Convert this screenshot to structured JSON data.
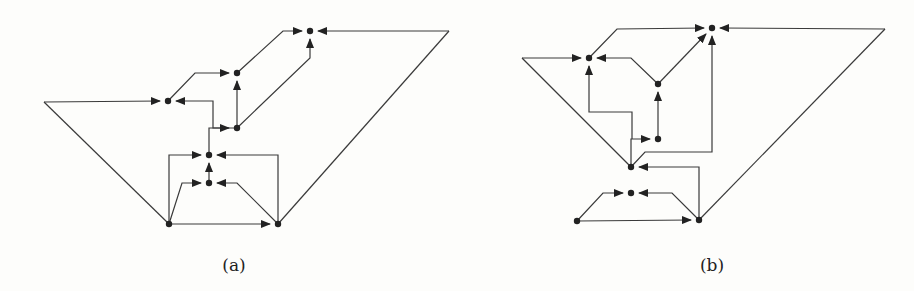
{
  "figures": [
    {
      "id": "a",
      "caption": "(a)",
      "caption_x": 234,
      "nodes": [
        {
          "id": "top",
          "x": 310,
          "y": 31
        },
        {
          "id": "upper",
          "x": 237,
          "y": 73
        },
        {
          "id": "left",
          "x": 168,
          "y": 101
        },
        {
          "id": "hub",
          "x": 237,
          "y": 128
        },
        {
          "id": "mid",
          "x": 209,
          "y": 155
        },
        {
          "id": "lowmid",
          "x": 209,
          "y": 183
        },
        {
          "id": "bl",
          "x": 169,
          "y": 224
        },
        {
          "id": "br",
          "x": 278,
          "y": 224
        }
      ],
      "edges": [
        {
          "points": [
            [
              44,
              102
            ],
            [
              160,
              101
            ]
          ],
          "arrow": true
        },
        {
          "points": [
            [
              44,
              102
            ],
            [
              169,
              224
            ]
          ],
          "arrow": false
        },
        {
          "points": [
            [
              237,
              128
            ],
            [
              213,
              128
            ],
            [
              213,
              101
            ],
            [
              176,
              101
            ]
          ],
          "arrow": true
        },
        {
          "points": [
            [
              168,
              101
            ],
            [
              195,
              73
            ],
            [
              229,
              73
            ]
          ],
          "arrow": true
        },
        {
          "points": [
            [
              237,
              128
            ],
            [
              237,
              81
            ]
          ],
          "arrow": true
        },
        {
          "points": [
            [
              237,
              73
            ],
            [
              283,
              31
            ],
            [
              302,
              31
            ]
          ],
          "arrow": true
        },
        {
          "points": [
            [
              237,
              128
            ],
            [
              310,
              58
            ],
            [
              310,
              39
            ]
          ],
          "arrow": true
        },
        {
          "points": [
            [
              449,
              31
            ],
            [
              318,
              31
            ]
          ],
          "arrow": true
        },
        {
          "points": [
            [
              449,
              31
            ],
            [
              278,
              224
            ]
          ],
          "arrow": false
        },
        {
          "points": [
            [
              209,
              155
            ],
            [
              209,
              128
            ],
            [
              229,
              128
            ]
          ],
          "arrow": true
        },
        {
          "points": [
            [
              169,
              224
            ],
            [
              169,
              155
            ],
            [
              201,
              155
            ]
          ],
          "arrow": true
        },
        {
          "points": [
            [
              278,
              224
            ],
            [
              278,
              155
            ],
            [
              217,
              155
            ]
          ],
          "arrow": true
        },
        {
          "points": [
            [
              209,
              183
            ],
            [
              209,
              163
            ]
          ],
          "arrow": true
        },
        {
          "points": [
            [
              169,
              224
            ],
            [
              182,
              183
            ],
            [
              201,
              183
            ]
          ],
          "arrow": true
        },
        {
          "points": [
            [
              278,
              224
            ],
            [
              237,
              183
            ],
            [
              217,
              183
            ]
          ],
          "arrow": true
        },
        {
          "points": [
            [
              169,
              224
            ],
            [
              270,
              224
            ]
          ],
          "arrow": true
        }
      ]
    },
    {
      "id": "b",
      "caption": "(b)",
      "caption_x": 712,
      "nodes": [
        {
          "id": "top",
          "x": 712,
          "y": 28
        },
        {
          "id": "left",
          "x": 589,
          "y": 58
        },
        {
          "id": "mid",
          "x": 658,
          "y": 84
        },
        {
          "id": "inner",
          "x": 658,
          "y": 139
        },
        {
          "id": "center",
          "x": 631,
          "y": 167
        },
        {
          "id": "small",
          "x": 631,
          "y": 193
        },
        {
          "id": "bl",
          "x": 577,
          "y": 221
        },
        {
          "id": "br",
          "x": 699,
          "y": 220
        }
      ],
      "edges": [
        {
          "points": [
            [
              522,
              58
            ],
            [
              581,
              58
            ]
          ],
          "arrow": true
        },
        {
          "points": [
            [
              522,
              58
            ],
            [
              631,
              167
            ]
          ],
          "arrow": false
        },
        {
          "points": [
            [
              658,
              84
            ],
            [
              631,
              58
            ],
            [
              597,
              58
            ]
          ],
          "arrow": true
        },
        {
          "points": [
            [
              632,
              139
            ],
            [
              632,
              112
            ],
            [
              589,
              112
            ],
            [
              589,
              66
            ]
          ],
          "arrow": true
        },
        {
          "points": [
            [
              589,
              58
            ],
            [
              617,
              29
            ],
            [
              704,
              28
            ]
          ],
          "arrow": true
        },
        {
          "points": [
            [
              658,
              84
            ],
            [
              706,
              34
            ]
          ],
          "arrow": true
        },
        {
          "points": [
            [
              658,
              139
            ],
            [
              658,
              92
            ]
          ],
          "arrow": true
        },
        {
          "points": [
            [
              631,
              167
            ],
            [
              631,
              139
            ],
            [
              650,
              139
            ]
          ],
          "arrow": true
        },
        {
          "points": [
            [
              631,
              167
            ],
            [
              645,
              152
            ],
            [
              712,
              152
            ],
            [
              712,
              36
            ]
          ],
          "arrow": true
        },
        {
          "points": [
            [
              885,
              29
            ],
            [
              720,
              28
            ]
          ],
          "arrow": true
        },
        {
          "points": [
            [
              885,
              29
            ],
            [
              699,
              220
            ]
          ],
          "arrow": false
        },
        {
          "points": [
            [
              699,
              220
            ],
            [
              699,
              167
            ],
            [
              639,
              167
            ]
          ],
          "arrow": true
        },
        {
          "points": [
            [
              577,
              221
            ],
            [
              603,
              193
            ],
            [
              623,
              193
            ]
          ],
          "arrow": true
        },
        {
          "points": [
            [
              699,
              220
            ],
            [
              672,
              193
            ],
            [
              639,
              193
            ]
          ],
          "arrow": true
        },
        {
          "points": [
            [
              577,
              221
            ],
            [
              691,
              220
            ]
          ],
          "arrow": true
        }
      ]
    }
  ],
  "style": {
    "stroke": "#3a3a3a",
    "node_fill": "#222222"
  }
}
